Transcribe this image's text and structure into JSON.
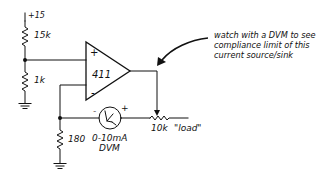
{
  "diagram": {
    "type": "circuit-schematic",
    "supply": {
      "label": "+15"
    },
    "divider": {
      "upper_resistor": {
        "label": "15k"
      },
      "lower_resistor": {
        "label": "1k"
      }
    },
    "opamp": {
      "label": "411",
      "noninverting_pin": "+",
      "inverting_pin": "-"
    },
    "sense_resistor": {
      "label": "180"
    },
    "meter": {
      "range_label": "0-10mA",
      "type_label": "DVM",
      "neg_terminal": "-",
      "pos_terminal": "+"
    },
    "load_resistor": {
      "value_label": "10k",
      "name_label": "\"load\""
    },
    "annotation": {
      "lines": [
        "watch with a DVM to see",
        "compliance limit of this",
        "current source/sink"
      ]
    }
  }
}
